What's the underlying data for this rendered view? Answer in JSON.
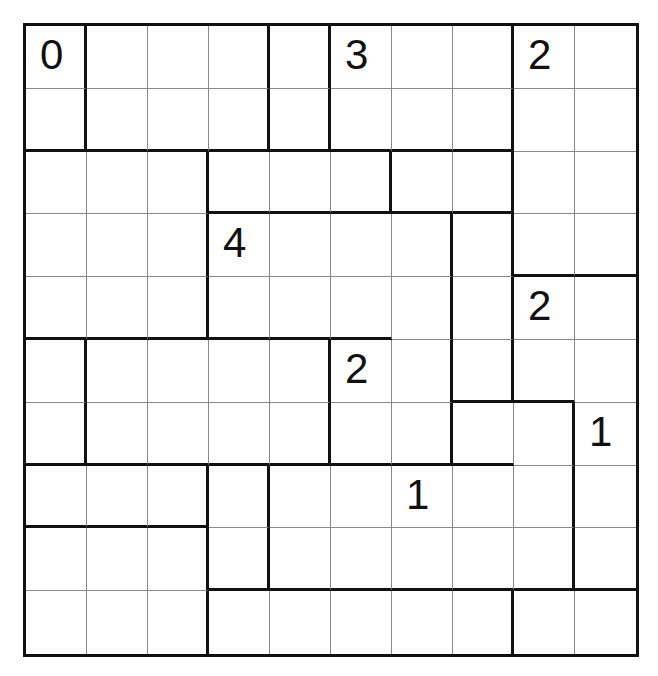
{
  "puzzle": {
    "rows": 10,
    "cols": 10,
    "clues": [
      {
        "r": 0,
        "c": 0,
        "v": "0"
      },
      {
        "r": 0,
        "c": 5,
        "v": "3"
      },
      {
        "r": 0,
        "c": 8,
        "v": "2"
      },
      {
        "r": 3,
        "c": 3,
        "v": "4"
      },
      {
        "r": 4,
        "c": 8,
        "v": "2"
      },
      {
        "r": 5,
        "c": 5,
        "v": "2"
      },
      {
        "r": 6,
        "c": 9,
        "v": "1"
      },
      {
        "r": 7,
        "c": 6,
        "v": "1"
      }
    ],
    "thick_right": [
      [
        0,
        3,
        4,
        7
      ],
      [
        0,
        3,
        4,
        7
      ],
      [
        2,
        5,
        7
      ],
      [
        2,
        6,
        7
      ],
      [
        2,
        6,
        7
      ],
      [
        0,
        4,
        6,
        7
      ],
      [
        0,
        4,
        6,
        8
      ],
      [
        2,
        3,
        8
      ],
      [
        2,
        3,
        8
      ],
      [
        2,
        7
      ]
    ],
    "thick_bottom": [
      [],
      [
        0,
        1,
        2,
        3,
        4,
        5,
        6,
        7
      ],
      [
        3,
        4,
        5,
        6,
        7
      ],
      [
        8,
        9
      ],
      [
        0,
        1,
        2,
        3,
        4,
        5
      ],
      [
        7,
        8
      ],
      [
        0,
        1,
        2,
        3,
        4,
        5,
        6,
        7
      ],
      [
        0,
        1,
        2
      ],
      [
        3,
        4,
        5,
        6,
        7,
        8,
        9
      ],
      []
    ]
  }
}
